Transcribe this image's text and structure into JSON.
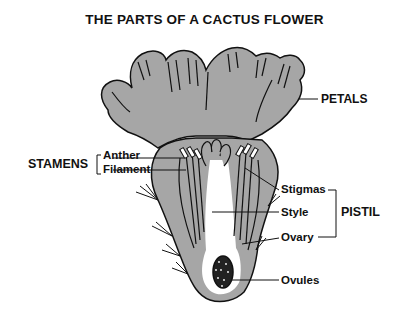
{
  "title": "THE PARTS OF A CACTUS FLOWER",
  "colors": {
    "fill": "#a6a6a6",
    "outline": "#111111",
    "background": "#ffffff"
  },
  "labels": {
    "petals": "PETALS",
    "stamens": "STAMENS",
    "anther": "Anther",
    "filament": "Filament",
    "stigmas": "Stigmas",
    "style": "Style",
    "ovary": "Ovary",
    "ovules": "Ovules",
    "pistil": "PISTIL"
  }
}
